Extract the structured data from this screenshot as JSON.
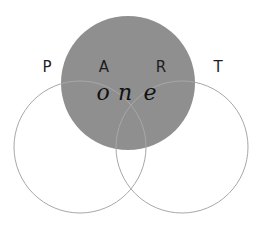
{
  "diagram": {
    "type": "venn",
    "colors": {
      "highlight_fill": "#8f8f8f",
      "outline_stroke": "#a8a8a8",
      "background": "#ffffff",
      "text": "#1e1e1e"
    },
    "circles": [
      {
        "id": "top",
        "cx": 128,
        "cy": 83,
        "r": 67,
        "filled": true
      },
      {
        "id": "left",
        "cx": 80,
        "cy": 147,
        "r": 66,
        "filled": false
      },
      {
        "id": "right",
        "cx": 182,
        "cy": 147,
        "r": 66,
        "filled": false
      }
    ],
    "letters": [
      {
        "text": "P",
        "x": 47,
        "y": 72
      },
      {
        "text": "A",
        "x": 104,
        "y": 72
      },
      {
        "text": "R",
        "x": 161,
        "y": 72
      },
      {
        "text": "T",
        "x": 218,
        "y": 72
      }
    ],
    "script_word": {
      "text": "one",
      "chars": [
        {
          "text": "o",
          "x": 103,
          "y": 100
        },
        {
          "text": "n",
          "x": 125,
          "y": 100
        },
        {
          "text": "e",
          "x": 150,
          "y": 100
        }
      ]
    }
  }
}
